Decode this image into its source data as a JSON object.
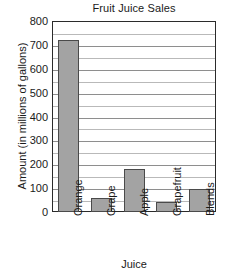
{
  "chart_data": {
    "type": "bar",
    "title": "Fruit Juice Sales",
    "xlabel": "Juice",
    "ylabel": "Amount (in millions of gallons)",
    "categories": [
      "Orange",
      "Grape",
      "Apple",
      "Grapefruit",
      "Blends"
    ],
    "values": [
      720,
      60,
      180,
      40,
      95
    ],
    "ylim": [
      0,
      800
    ],
    "ytick_step": 100,
    "yticks": [
      800,
      700,
      600,
      500,
      400,
      300,
      200,
      100,
      0
    ],
    "ytick_labels": [
      "800",
      "700",
      "600",
      "500",
      "400",
      "300",
      "200",
      "100",
      "0"
    ],
    "minor_gridline_step": 50,
    "grid": true,
    "legend": false,
    "legend_position": "none",
    "bar_color": "#a3a3a3",
    "bar_edge_color": "#4a4a4a",
    "gridline_color": "#b9b9b9",
    "axis_color": "#2b2b2b",
    "x_tick_rotation": 90
  }
}
